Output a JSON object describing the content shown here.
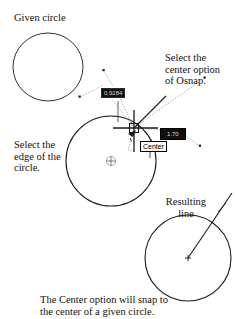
{
  "figure": {
    "title_caption_line1": "The Center option will snap to",
    "title_caption_line2": "the center of a given circle."
  },
  "labels": {
    "given_circle": "Given circle",
    "osnap_note": "Select the\ncenter option\nof Osnap.",
    "edge_note": "Select the\nedge of the\ncircle.",
    "resulting_line": "Resulting\nline"
  },
  "tooltips": {
    "distance_value": "0.9284",
    "angle_value": "1.70",
    "snap_name": "Center"
  },
  "icons": {
    "center_marker": "circled-plus",
    "cursor": "crosshair-pickbox"
  },
  "colors": {
    "ink": "#000000",
    "paper": "#ffffff",
    "tooltip_dark_bg": "#101010",
    "tooltip_dark_text": "#d8d8d8",
    "tooltip_light_bg": "#ffffff"
  }
}
